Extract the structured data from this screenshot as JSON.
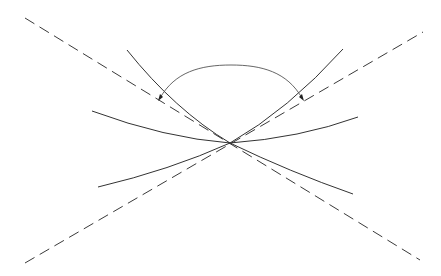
{
  "diagram": {
    "title": "",
    "colors": {
      "background": "#ffffff",
      "dashed_line": "#3a3a3a",
      "curve": "#333333",
      "arc": "#555555",
      "arrowhead": "#222222"
    },
    "center": {
      "x": 230,
      "y": 143
    },
    "dashed_lines": [
      {
        "id": "dashed-line-descending",
        "from": [
          25,
          18
        ],
        "to": [
          420,
          260
        ]
      },
      {
        "id": "dashed-line-ascending",
        "from": [
          25,
          263
        ],
        "to": [
          423,
          32
        ]
      }
    ],
    "curves": [
      {
        "id": "steep-curve-left",
        "from": [
          127,
          50
        ],
        "to": [
          230,
          143
        ]
      },
      {
        "id": "steep-curve-right",
        "from": [
          230,
          143
        ],
        "to": [
          343,
          49
        ]
      },
      {
        "id": "flat-curve-upper-left",
        "from": [
          92,
          111
        ],
        "to": [
          230,
          143
        ]
      },
      {
        "id": "flat-curve-upper-right",
        "from": [
          230,
          143
        ],
        "to": [
          358,
          117
        ]
      },
      {
        "id": "flat-curve-lower-left",
        "from": [
          98,
          187
        ],
        "to": [
          230,
          143
        ]
      },
      {
        "id": "flat-curve-lower-right",
        "from": [
          230,
          143
        ],
        "to": [
          353,
          194
        ]
      }
    ],
    "angle_arc": {
      "from": [
        160,
        99
      ],
      "apex": [
        230,
        65
      ],
      "to": [
        302,
        99
      ],
      "arrowheads": 2
    },
    "labels": []
  }
}
